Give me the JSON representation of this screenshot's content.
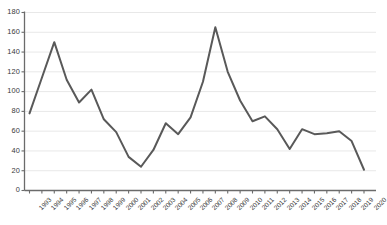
{
  "chart_data": {
    "type": "line",
    "title": "",
    "subtitle": "",
    "xlabel": "",
    "ylabel": "",
    "categories": [
      "1993",
      "1994",
      "1995",
      "1996",
      "1997",
      "1998",
      "1999",
      "2000",
      "2001",
      "2002",
      "2003",
      "2004",
      "2005",
      "2006",
      "2007",
      "2008",
      "2009",
      "2010",
      "2011",
      "2012",
      "2013",
      "2014",
      "2015",
      "2016",
      "2017",
      "2018",
      "2019",
      "2020"
    ],
    "values": [
      78,
      114,
      150,
      112,
      89,
      102,
      72,
      59,
      34,
      24,
      41,
      68,
      57,
      74,
      110,
      165,
      120,
      91,
      70,
      75,
      62,
      42,
      62,
      57,
      58,
      60,
      50,
      21
    ],
    "series": [
      {
        "name": "series-1",
        "color": "#595959",
        "values": [
          78,
          114,
          150,
          112,
          89,
          102,
          72,
          59,
          34,
          24,
          41,
          68,
          57,
          74,
          110,
          165,
          120,
          91,
          70,
          75,
          62,
          42,
          62,
          57,
          58,
          60,
          50,
          21
        ]
      }
    ],
    "ylim": [
      0,
      180
    ],
    "ytick_values": [
      0,
      20,
      40,
      60,
      80,
      100,
      120,
      140,
      160,
      180
    ],
    "ytick_labels": [
      "0",
      "20",
      "40",
      "60",
      "80",
      "100",
      "120",
      "140",
      "160",
      "180"
    ],
    "grid": true,
    "grid_axis": "y",
    "grid_color": "#e8e8e8",
    "legend": false,
    "legend_position": "none",
    "axis_color": "#6b6b6b",
    "line_color": "#595959",
    "line_width": 2,
    "background": "#ffffff",
    "markers": false
  }
}
